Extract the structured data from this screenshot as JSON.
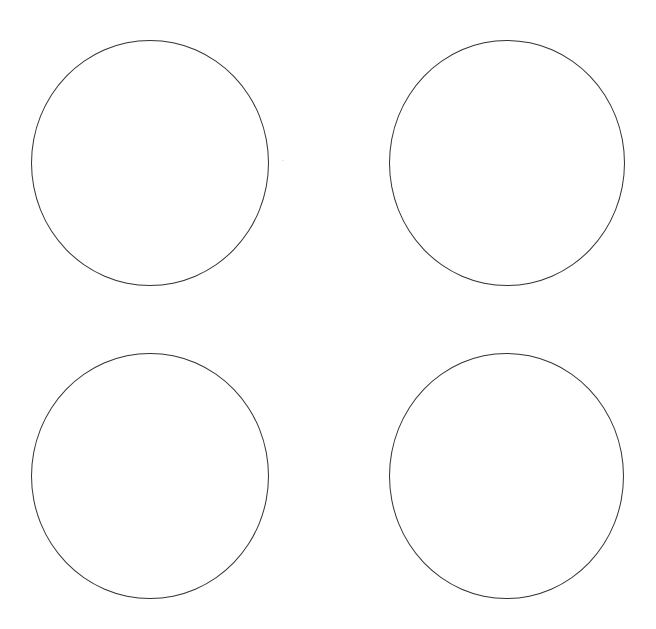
{
  "page": {
    "background": "#ffffff",
    "clipped_header_text": ""
  },
  "shapes": {
    "stroke_color": "#333333",
    "stroke_width": 1.3,
    "circles": [
      {
        "name": "circle-top-left",
        "left": 31,
        "top": 40,
        "width": 238,
        "height": 246
      },
      {
        "name": "circle-top-right",
        "left": 389,
        "top": 40,
        "width": 236,
        "height": 246
      },
      {
        "name": "circle-bottom-left",
        "left": 31,
        "top": 353,
        "width": 238,
        "height": 246
      },
      {
        "name": "circle-bottom-right",
        "left": 389,
        "top": 353,
        "width": 235,
        "height": 246
      }
    ]
  }
}
